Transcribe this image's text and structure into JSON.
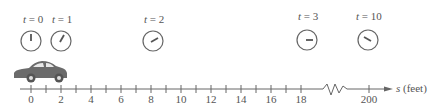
{
  "clocks": [
    {
      "label_var": "t",
      "label_eq": " = 0",
      "cx": 31,
      "cy": 41,
      "hand_angle_deg": 0
    },
    {
      "label_var": "t",
      "label_eq": " = 1",
      "cx": 61,
      "cy": 41,
      "hand_angle_deg": 30
    },
    {
      "label_var": "t",
      "label_eq": " = 2",
      "cx": 153,
      "cy": 41,
      "hand_angle_deg": 60
    },
    {
      "label_var": "t",
      "label_eq": " = 3",
      "cx": 307,
      "cy": 40,
      "hand_angle_deg": 90
    },
    {
      "label_var": "t",
      "label_eq": " = 10",
      "cx": 368,
      "cy": 40,
      "hand_angle_deg": 120
    }
  ],
  "axis": {
    "ticks": [
      "0",
      "",
      "2",
      "",
      "4",
      "",
      "6",
      "",
      "8",
      "",
      "10",
      "",
      "12",
      "",
      "14",
      "",
      "16",
      "",
      "18"
    ],
    "far_tick": "200",
    "axis_label_var": "s",
    "axis_label_unit": " (feet)"
  },
  "colors": {
    "ink": "#555555",
    "car": "#6b6b6b"
  }
}
